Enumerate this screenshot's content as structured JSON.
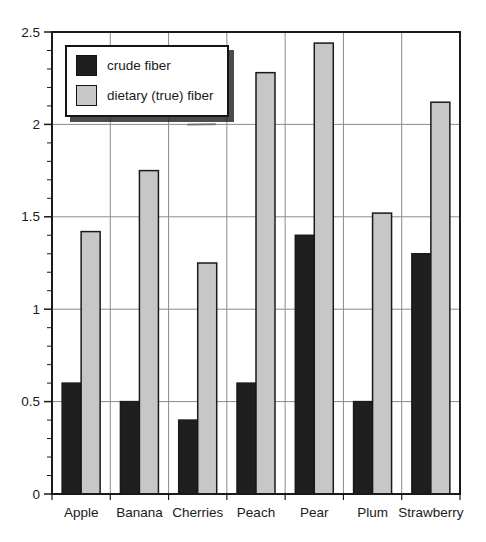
{
  "figure": {
    "background": "#ffffff"
  },
  "chart_data": {
    "type": "bar",
    "title": "",
    "xlabel": "",
    "ylabel": "",
    "categories": [
      "Apple",
      "Banana",
      "Cherries",
      "Peach",
      "Pear",
      "Plum",
      "Strawberry"
    ],
    "series": [
      {
        "name": "crude fiber",
        "color": "#1f1f1f",
        "values": [
          0.6,
          0.5,
          0.4,
          0.6,
          1.4,
          0.5,
          1.3
        ]
      },
      {
        "name": "dietary (true) fiber",
        "color": "#c7c7c7",
        "values": [
          1.42,
          1.75,
          1.25,
          2.28,
          2.44,
          1.52,
          2.12
        ]
      }
    ],
    "ylim": [
      0,
      2.5
    ],
    "y_major_step": 0.5,
    "y_minor_step": 0.1,
    "y_tick_labels": [
      "0",
      "0.5",
      "1",
      "1.5",
      "2",
      "2.5"
    ],
    "grid": true,
    "legend_position": "top-left",
    "axis_color": "#1a1a1a",
    "grid_color": "#8c8c8c",
    "bar_outline": "#1a1a1a",
    "legend_shadow_color": "#2d2d2d"
  }
}
